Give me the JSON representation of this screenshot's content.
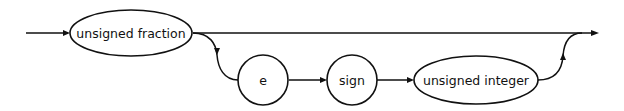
{
  "diagram": {
    "type": "syntax-railroad-diagram",
    "colors": {
      "stroke": "#111111",
      "background": "#ffffff"
    },
    "nodes": [
      {
        "id": "unsigned-fraction",
        "label": "unsigned fraction",
        "shape": "oval"
      },
      {
        "id": "e",
        "label": "e",
        "shape": "circle"
      },
      {
        "id": "sign",
        "label": "sign",
        "shape": "circle"
      },
      {
        "id": "unsigned-integer",
        "label": "unsigned integer",
        "shape": "oval"
      }
    ],
    "paths": [
      {
        "from": "entry",
        "to": "unsigned-fraction"
      },
      {
        "from": "unsigned-fraction",
        "to": "exit",
        "note": "bypass (top line)"
      },
      {
        "from": "unsigned-fraction",
        "to": "e",
        "note": "optional exponent branch"
      },
      {
        "from": "e",
        "to": "sign"
      },
      {
        "from": "sign",
        "to": "unsigned-integer"
      },
      {
        "from": "unsigned-integer",
        "to": "exit"
      }
    ]
  }
}
